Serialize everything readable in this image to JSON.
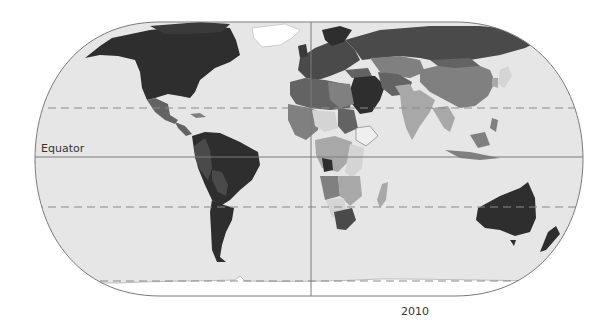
{
  "map": {
    "type": "choropleth world map",
    "projection": "Robinson-like rounded rectangle",
    "labels": {
      "equator": "Equator",
      "year": "2010"
    },
    "reference_lines": [
      "Equator (solid)",
      "Tropic of Cancer (dashed)",
      "Tropic of Capricorn (dashed)",
      "Antarctic Circle (dashed)",
      "Prime Meridian (solid)"
    ],
    "palette": {
      "ocean": "#e6e6e6",
      "darkest": "#2e2e2e",
      "dark": "#4a4a4a",
      "medium_dark": "#636363",
      "medium": "#808080",
      "light": "#a8a8a8",
      "lightest": "#d4d4d4",
      "no_data": "#efefef",
      "frame": "#7a7a7a",
      "grid": "#8a8a8a"
    }
  }
}
